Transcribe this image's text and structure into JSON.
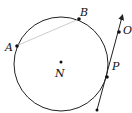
{
  "diagram": {
    "type": "geometry",
    "circle": {
      "center": [
        61,
        63
      ],
      "radius": 47,
      "stroke": "#222222"
    },
    "chord": {
      "from": "A",
      "to": "B",
      "stroke": "#cccccc"
    },
    "tangent_line": {
      "through": [
        "P",
        "O"
      ],
      "direction": "arrow-up",
      "stroke": "#222222"
    },
    "points": [
      {
        "id": "A",
        "label": "A",
        "x": 16,
        "y": 46
      },
      {
        "id": "B",
        "label": "B",
        "x": 79,
        "y": 19
      },
      {
        "id": "N",
        "label": "N",
        "x": 61,
        "y": 63
      },
      {
        "id": "P",
        "label": "P",
        "x": 107,
        "y": 77
      },
      {
        "id": "O",
        "label": "O",
        "x": 120,
        "y": 33
      }
    ]
  }
}
